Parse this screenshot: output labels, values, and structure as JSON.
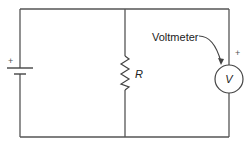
{
  "diagram": {
    "type": "circuit-schematic",
    "components": {
      "battery": {
        "polarity_label": "+"
      },
      "resistor": {
        "label": "R"
      },
      "voltmeter": {
        "symbol": "V",
        "polarity_label": "+",
        "callout_label": "Voltmeter"
      }
    },
    "colors": {
      "wire": "#555555",
      "text": "#222222",
      "background": "#ffffff"
    }
  }
}
